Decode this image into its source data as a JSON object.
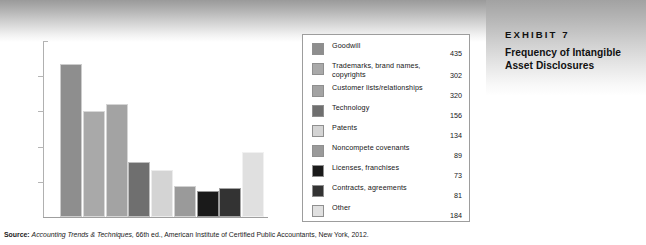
{
  "exhibit": {
    "number_label": "EXHIBIT 7",
    "title": "Frequency of Intangible Asset Disclosures"
  },
  "source": {
    "label": "Source:",
    "italic_part": "Accounting Trends & Techniques,",
    "rest": " 66th ed., American Institute of Certified Public Accountants, New York, 2012."
  },
  "chart_data": {
    "type": "bar",
    "title": "Frequency of Intangible Asset Disclosures",
    "xlabel": "",
    "ylabel": "",
    "ylim": [
      0,
      500
    ],
    "grid": false,
    "legend_position": "right",
    "categories": [
      "Goodwill",
      "Trademarks, brand names, copyrights",
      "Customer lists/relationships",
      "Technology",
      "Patents",
      "Noncompete covenants",
      "Licenses, franchises",
      "Contracts, agreements",
      "Other"
    ],
    "values": [
      435,
      302,
      320,
      156,
      134,
      89,
      73,
      81,
      184
    ],
    "colors": [
      "#8e8e8e",
      "#a9a9a9",
      "#a3a3a3",
      "#6f6f6f",
      "#d4d4d4",
      "#9a9a9a",
      "#1a1a1a",
      "#333333",
      "#e0e0e0"
    ]
  },
  "legend": {
    "items": [
      {
        "label": "Goodwill",
        "value": "435",
        "color": "#8e8e8e"
      },
      {
        "label": "Trademarks, brand names, copyrights",
        "value": "302",
        "color": "#a9a9a9"
      },
      {
        "label": "Customer lists/relationships",
        "value": "320",
        "color": "#a3a3a3"
      },
      {
        "label": "Technology",
        "value": "156",
        "color": "#6f6f6f"
      },
      {
        "label": "Patents",
        "value": "134",
        "color": "#d4d4d4"
      },
      {
        "label": "Noncompete covenants",
        "value": "89",
        "color": "#9a9a9a"
      },
      {
        "label": "Licenses, franchises",
        "value": "73",
        "color": "#1a1a1a"
      },
      {
        "label": "Contracts, agreements",
        "value": "81",
        "color": "#333333"
      },
      {
        "label": "Other",
        "value": "184",
        "color": "#e0e0e0"
      }
    ]
  },
  "axis": {
    "tick_positions_pct": [
      20,
      40,
      60,
      80
    ]
  }
}
